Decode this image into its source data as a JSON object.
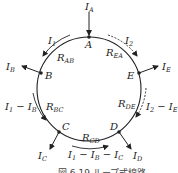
{
  "diagram": {
    "type": "loop-distribution-circuit",
    "caption": "図 6.19 ループ式線路",
    "colors": {
      "line": "#222222",
      "background": "#ffffff",
      "text": "#222222"
    },
    "nodes": [
      {
        "id": "A",
        "label": "A",
        "current": {
          "main": "I",
          "sub": "A"
        },
        "direction": "in"
      },
      {
        "id": "B",
        "label": "B",
        "current": {
          "main": "I",
          "sub": "B"
        },
        "direction": "out"
      },
      {
        "id": "C",
        "label": "C",
        "current": {
          "main": "I",
          "sub": "C"
        },
        "direction": "out"
      },
      {
        "id": "D",
        "label": "D",
        "current": {
          "main": "I",
          "sub": "D"
        },
        "direction": "out"
      },
      {
        "id": "E",
        "label": "E",
        "current": {
          "main": "I",
          "sub": "E"
        },
        "direction": "out"
      }
    ],
    "resistances": [
      {
        "main": "R",
        "sub": "AB"
      },
      {
        "main": "R",
        "sub": "BC"
      },
      {
        "main": "R",
        "sub": "CD"
      },
      {
        "main": "R",
        "sub": "DE"
      },
      {
        "main": "R",
        "sub": "EA"
      }
    ],
    "branch_currents": {
      "ab": {
        "main": "I",
        "sub": "1",
        "style": "solid"
      },
      "bc": {
        "text": "I₁ − I_B",
        "parts": [
          "I",
          "1",
          " − I",
          "B"
        ],
        "style": "solid"
      },
      "cd": {
        "text": "I₁ − I_B − I_C",
        "parts": [
          "I",
          "1",
          " − I",
          "B",
          " − I",
          "C"
        ],
        "style": "solid"
      },
      "ea": {
        "main": "I",
        "sub": "2",
        "style": "dashed"
      },
      "de": {
        "text": "I₂ − I_E",
        "parts": [
          "I",
          "2",
          " − I",
          "E"
        ],
        "style": "dashed"
      }
    }
  }
}
